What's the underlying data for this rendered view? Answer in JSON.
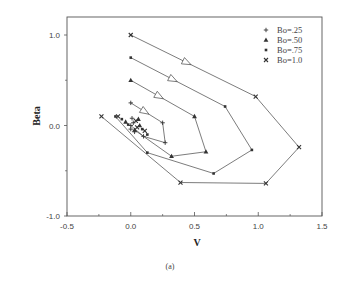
{
  "chart_data": {
    "type": "line",
    "title": "",
    "caption": "(a)",
    "xlabel": "V",
    "ylabel": "Beta",
    "xlim": [
      -0.5,
      1.5
    ],
    "ylim": [
      -1.0,
      1.0
    ],
    "x_ticks": [
      "-0.5",
      "0.0",
      "0.5",
      "1.0",
      "1.5"
    ],
    "y_ticks": [
      "-1.0",
      "0.0",
      "1.0"
    ],
    "grid": false,
    "legend_position": "upper right",
    "series": [
      {
        "name": "Bo=.25",
        "marker": "plus",
        "x": [
          0.0,
          0.25,
          0.27,
          0.1,
          0.0
        ],
        "y": [
          0.25,
          0.03,
          -0.19,
          -0.12,
          0.0
        ]
      },
      {
        "name": "Bo=.50",
        "marker": "triangle",
        "x": [
          0.0,
          0.5,
          0.59,
          0.32,
          0.03
        ],
        "y": [
          0.5,
          0.1,
          -0.29,
          -0.34,
          -0.05
        ]
      },
      {
        "name": "Bo=.75",
        "marker": "square",
        "x": [
          0.0,
          0.74,
          0.95,
          0.65,
          0.13,
          -0.12
        ],
        "y": [
          0.75,
          0.21,
          -0.27,
          -0.53,
          -0.3,
          0.1
        ]
      },
      {
        "name": "Bo=1.0",
        "marker": "x",
        "x": [
          0.0,
          0.98,
          1.32,
          1.06,
          0.39,
          -0.23
        ],
        "y": [
          1.0,
          0.32,
          -0.24,
          -0.64,
          -0.63,
          0.1
        ]
      }
    ]
  },
  "legend": {
    "items": [
      {
        "label": "Bo=.25",
        "symbol": "+"
      },
      {
        "label": "Bo=.50",
        "symbol": "▲"
      },
      {
        "label": "Bo=.75",
        "symbol": "▪"
      },
      {
        "label": "Bo=1.0",
        "symbol": "×"
      }
    ]
  },
  "axes": {
    "x_label": "V",
    "y_label": "Beta",
    "caption": "(a)",
    "x_ticks": [
      "-0.5",
      "0.0",
      "0.5",
      "1.0",
      "1.5"
    ],
    "y_ticks": [
      "1.0",
      "0.0",
      "-1.0"
    ]
  }
}
